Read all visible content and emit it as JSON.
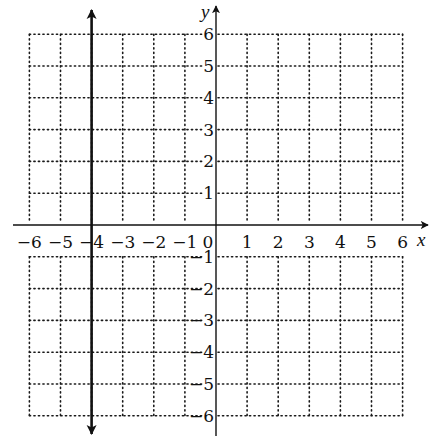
{
  "chart_data": {
    "type": "line",
    "title": "",
    "xlabel": "x",
    "ylabel": "y",
    "xlim": [
      -6,
      6
    ],
    "ylim": [
      -6,
      6
    ],
    "grid": true,
    "grid_style": "dotted",
    "x_ticks": [
      -6,
      -5,
      -4,
      -3,
      -2,
      -1,
      0,
      1,
      2,
      3,
      4,
      5,
      6
    ],
    "y_ticks": [
      -6,
      -5,
      -4,
      -3,
      -2,
      -1,
      1,
      2,
      3,
      4,
      5,
      6
    ],
    "x_tick_labels": [
      "−6",
      "−5",
      "−4",
      "−3",
      "−2",
      "−1",
      "0",
      "1",
      "2",
      "3",
      "4",
      "5",
      "6"
    ],
    "y_tick_labels": [
      "−6",
      "−5",
      "−4",
      "−3",
      "−2",
      "−1",
      "1",
      "2",
      "3",
      "4",
      "5",
      "6"
    ],
    "series": [
      {
        "name": "x = -4",
        "kind": "vertical-line",
        "x": [
          -4,
          -4
        ],
        "y": [
          -6.5,
          6.5
        ],
        "arrows": "both"
      }
    ],
    "legend": null
  },
  "labels": {
    "x_axis": "x",
    "y_axis": "y"
  }
}
